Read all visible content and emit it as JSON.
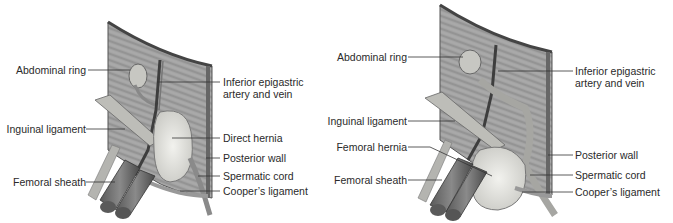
{
  "figures": [
    {
      "id": "direct",
      "labels_left": [
        {
          "text": "Abdominal ring"
        },
        {
          "text": "Inguinal ligament"
        },
        {
          "text": "Femoral sheath"
        }
      ],
      "labels_right": [
        {
          "text": "Inferior epigastric",
          "line2": "artery and vein"
        },
        {
          "text": "Direct hernia"
        },
        {
          "text": "Posterior wall"
        },
        {
          "text": "Spermatic cord"
        },
        {
          "text": "Cooper’s ligament"
        }
      ]
    },
    {
      "id": "femoral",
      "labels_left": [
        {
          "text": "Abdominal ring"
        },
        {
          "text": "Inguinal ligament"
        },
        {
          "text": "Femoral hernia"
        },
        {
          "text": "Femoral sheath"
        }
      ],
      "labels_right": [
        {
          "text": "Inferior epigastric",
          "line2": "artery and vein"
        },
        {
          "text": "Posterior wall"
        },
        {
          "text": "Spermatic cord"
        },
        {
          "text": "Cooper’s ligament"
        }
      ]
    }
  ],
  "colors": {
    "muscle": "#9a9a9a",
    "muscle_dark": "#6e6e6e",
    "hernia": "#e4e4e0",
    "vessel": "#555555",
    "leader": "#333333"
  }
}
